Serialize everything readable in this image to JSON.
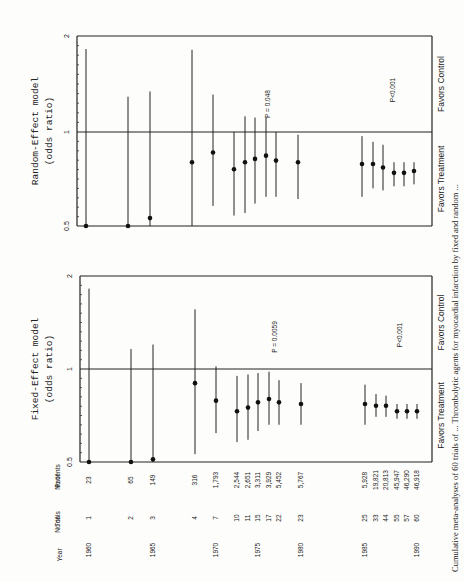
{
  "figure": {
    "caption": "Cumulative meta-analyses of 60 trials of ... Thrombolytic agents for myocardial infarction by fixed and random ...",
    "columns": {
      "year_header": "Year",
      "trials_header_line1": "No of",
      "trials_header_line2": "Trials",
      "patients_header_line1": "No of",
      "patients_header_line2": "Patients"
    },
    "favors_treatment": "Favors Treatment",
    "favors_control": "Favors Control"
  },
  "chart_data": [
    {
      "type": "scatter",
      "subtype": "forest-plot-cumulative",
      "title": "Random-Effect model",
      "subtitle": "(odds ratio)",
      "ylabel": "odds ratio",
      "yscale": "log",
      "ylim": [
        0.5,
        2
      ],
      "yticks": [
        "0.5",
        "1",
        "2"
      ],
      "annotations": [
        "P = 0.048",
        "P<0.001"
      ],
      "rows": [
        {
          "year": "1960",
          "trials": 1,
          "patients": "23",
          "or": 0.5,
          "lo": 0.5,
          "hi": 1.82
        },
        {
          "year": "",
          "trials": 2,
          "patients": "65",
          "or": 0.5,
          "lo": 0.5,
          "hi": 1.29
        },
        {
          "year": "1965",
          "trials": 3,
          "patients": "149",
          "or": 0.53,
          "lo": 0.5,
          "hi": 1.34
        },
        {
          "year": "",
          "trials": 4,
          "patients": "316",
          "or": 0.8,
          "lo": 0.5,
          "hi": 1.81
        },
        {
          "year": "1970",
          "trials": 7,
          "patients": "1,793",
          "or": 0.86,
          "lo": 0.58,
          "hi": 1.31
        },
        {
          "year": "",
          "trials": 10,
          "patients": "2,544",
          "or": 0.76,
          "lo": 0.54,
          "hi": 1.0
        },
        {
          "year": "",
          "trials": 11,
          "patients": "2,651",
          "or": 0.8,
          "lo": 0.55,
          "hi": 1.12
        },
        {
          "year": "1975",
          "trials": 15,
          "patients": "3,311",
          "or": 0.82,
          "lo": 0.59,
          "hi": 1.11
        },
        {
          "year": "",
          "trials": 17,
          "patients": "3,929",
          "or": 0.84,
          "lo": 0.62,
          "hi": 1.11
        },
        {
          "year": "",
          "trials": 22,
          "patients": "5,452",
          "or": 0.81,
          "lo": 0.62,
          "hi": 1.0
        },
        {
          "year": "1980",
          "trials": 23,
          "patients": "5,767",
          "or": 0.8,
          "lo": 0.61,
          "hi": 0.98
        },
        {
          "year": "1985",
          "trials": 25,
          "patients": "5,928",
          "or": 0.79,
          "lo": 0.62,
          "hi": 0.97
        },
        {
          "year": "",
          "trials": 33,
          "patients": "19,821",
          "or": 0.79,
          "lo": 0.66,
          "hi": 0.93
        },
        {
          "year": "",
          "trials": 44,
          "patients": "20,813",
          "or": 0.77,
          "lo": 0.65,
          "hi": 0.91
        },
        {
          "year": "",
          "trials": 55,
          "patients": "45,947",
          "or": 0.74,
          "lo": 0.67,
          "hi": 0.8
        },
        {
          "year": "",
          "trials": 57,
          "patients": "46,290",
          "or": 0.74,
          "lo": 0.67,
          "hi": 0.8
        },
        {
          "year": "1990",
          "trials": 60,
          "patients": "46,918",
          "or": 0.75,
          "lo": 0.68,
          "hi": 0.8
        }
      ]
    },
    {
      "type": "scatter",
      "subtype": "forest-plot-cumulative",
      "title": "Fixed-Effect model",
      "subtitle": "(odds ratio)",
      "ylabel": "odds ratio",
      "yscale": "log",
      "ylim": [
        0.5,
        2
      ],
      "yticks": [
        "0.5",
        "1",
        "2"
      ],
      "annotations": [
        "P = 0.0059",
        "P<0.001"
      ],
      "rows": [
        {
          "year": "1960",
          "trials": 1,
          "patients": "23",
          "or": 0.5,
          "lo": 0.5,
          "hi": 1.82
        },
        {
          "year": "",
          "trials": 2,
          "patients": "65",
          "or": 0.5,
          "lo": 0.5,
          "hi": 1.16
        },
        {
          "year": "1965",
          "trials": 3,
          "patients": "149",
          "or": 0.51,
          "lo": 0.5,
          "hi": 1.2
        },
        {
          "year": "",
          "trials": 4,
          "patients": "316",
          "or": 0.9,
          "lo": 0.53,
          "hi": 1.56
        },
        {
          "year": "1970",
          "trials": 7,
          "patients": "1,793",
          "or": 0.79,
          "lo": 0.62,
          "hi": 1.02
        },
        {
          "year": "",
          "trials": 10,
          "patients": "2,544",
          "or": 0.73,
          "lo": 0.58,
          "hi": 0.95
        },
        {
          "year": "",
          "trials": 11,
          "patients": "2,651",
          "or": 0.75,
          "lo": 0.59,
          "hi": 0.96
        },
        {
          "year": "1975",
          "trials": 15,
          "patients": "3,311",
          "or": 0.78,
          "lo": 0.63,
          "hi": 0.97
        },
        {
          "year": "",
          "trials": 17,
          "patients": "3,929",
          "or": 0.8,
          "lo": 0.66,
          "hi": 0.98
        },
        {
          "year": "",
          "trials": 22,
          "patients": "5,452",
          "or": 0.78,
          "lo": 0.66,
          "hi": 0.92
        },
        {
          "year": "1980",
          "trials": 23,
          "patients": "5,767",
          "or": 0.77,
          "lo": 0.66,
          "hi": 0.9
        },
        {
          "year": "1985",
          "trials": 25,
          "patients": "5,928",
          "or": 0.77,
          "lo": 0.66,
          "hi": 0.89
        },
        {
          "year": "",
          "trials": 33,
          "patients": "19,821",
          "or": 0.76,
          "lo": 0.7,
          "hi": 0.83
        },
        {
          "year": "",
          "trials": 44,
          "patients": "20,813",
          "or": 0.76,
          "lo": 0.7,
          "hi": 0.82
        },
        {
          "year": "",
          "trials": 55,
          "patients": "45,947",
          "or": 0.73,
          "lo": 0.69,
          "hi": 0.77
        },
        {
          "year": "",
          "trials": 57,
          "patients": "46,290",
          "or": 0.73,
          "lo": 0.69,
          "hi": 0.77
        },
        {
          "year": "1990",
          "trials": 60,
          "patients": "46,918",
          "or": 0.73,
          "lo": 0.69,
          "hi": 0.77
        }
      ]
    }
  ]
}
